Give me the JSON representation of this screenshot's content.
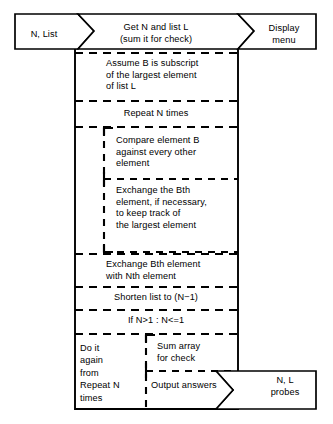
{
  "diagram": {
    "type": "structured-flowchart",
    "colors": {
      "stroke": "#000000",
      "background": "#ffffff",
      "text": "#000000"
    },
    "input_left": {
      "label": "N, List",
      "shape": "arrow-right"
    },
    "header": {
      "label": "Get N and list L\n(sum it for check)"
    },
    "output_top_right": {
      "label": "Display\nmenu",
      "shape": "arrow-right-tail"
    },
    "steps": [
      {
        "id": "assume",
        "label": "Assume B is subscript\nof the largest element\nof list L",
        "level": 1
      },
      {
        "id": "repeat",
        "label": "Repeat N times",
        "level": 1
      },
      {
        "id": "compare",
        "label": "Compare element B\nagainst every other\nelement",
        "level": 2
      },
      {
        "id": "exchange-bth",
        "label": "Exchange the Bth\nelement, if necessary,\nto keep track of\nthe largest element",
        "level": 2
      },
      {
        "id": "exchange-nth",
        "label": "Exchange Bth element\nwith Nth element",
        "level": 1
      },
      {
        "id": "shorten",
        "label": "Shorten list to (N−1)",
        "level": 1
      },
      {
        "id": "condition",
        "label": "If N>1 : N<=1",
        "level": 1
      }
    ],
    "footer": {
      "left_branch": "Do it\nagain\nfrom\nRepeat N\ntimes",
      "right_top": "Sum array\nfor check",
      "right_bottom": "Output answers"
    },
    "output_bottom_right": {
      "label": "N, L\nprobes",
      "shape": "arrow-right-tail"
    }
  }
}
